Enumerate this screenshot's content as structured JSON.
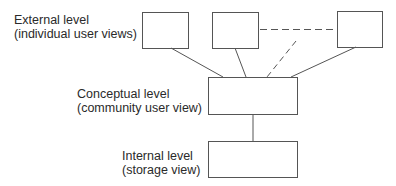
{
  "diagram": {
    "levels": {
      "external": {
        "line1": "External level",
        "line2": "(individual user views)"
      },
      "conceptual": {
        "line1": "Conceptual level",
        "line2": "(community user view)"
      },
      "internal": {
        "line1": "Internal level",
        "line2": "(storage view)"
      }
    },
    "boxes": [
      {
        "id": "external-view-1",
        "x": 142,
        "y": 12,
        "w": 46,
        "h": 36
      },
      {
        "id": "external-view-2",
        "x": 212,
        "y": 12,
        "w": 46,
        "h": 36
      },
      {
        "id": "external-view-3",
        "x": 337,
        "y": 11,
        "w": 45,
        "h": 36
      },
      {
        "id": "conceptual",
        "x": 208,
        "y": 77,
        "w": 89,
        "h": 37
      },
      {
        "id": "internal",
        "x": 208,
        "y": 141,
        "w": 89,
        "h": 36
      }
    ],
    "colors": {
      "stroke": "#555555",
      "text": "#2a2a2a"
    }
  }
}
